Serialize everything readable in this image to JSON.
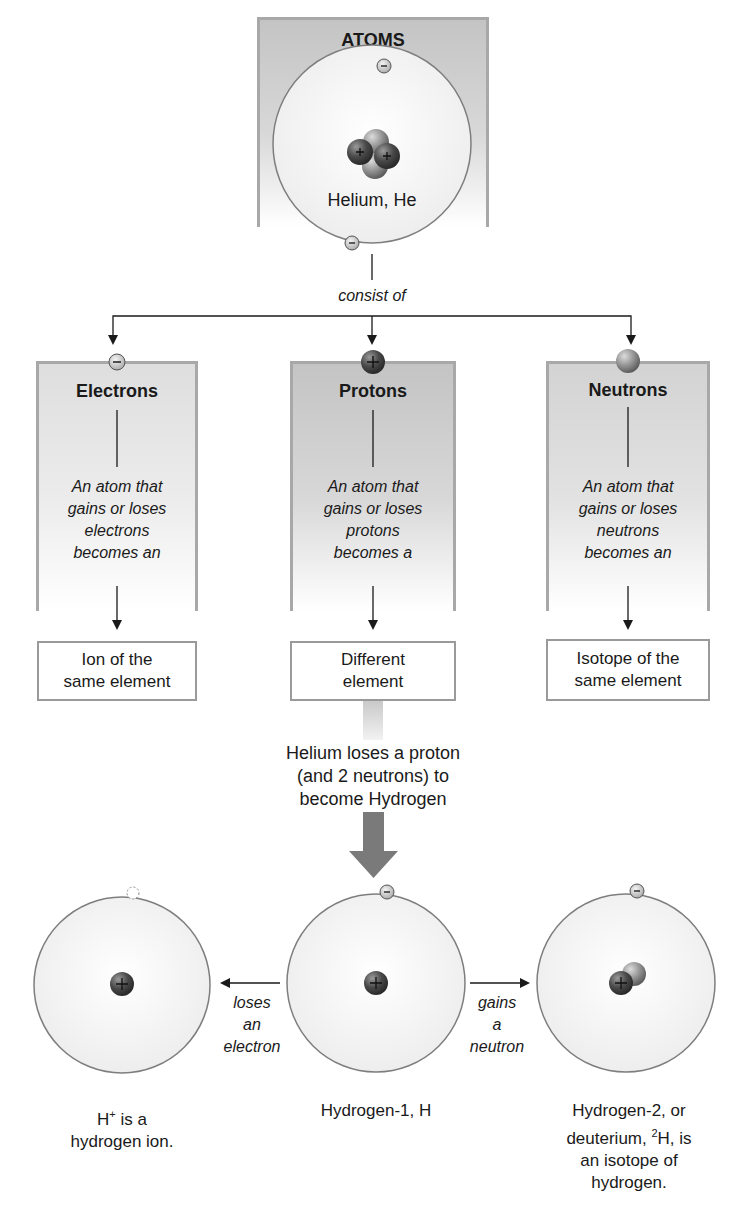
{
  "title": "ATOMS",
  "helium_label": "Helium, He",
  "connector_label": "consist of",
  "particles": [
    {
      "name": "Electrons",
      "description_lines": [
        "An atom that",
        "gains or loses",
        "electrons",
        "becomes an"
      ],
      "result_lines": [
        "Ion of the",
        "same element"
      ],
      "charge": "-"
    },
    {
      "name": "Protons",
      "description_lines": [
        "An atom that",
        "gains or loses",
        "protons",
        "becomes a"
      ],
      "result_lines": [
        "Different",
        "element"
      ],
      "charge": "+"
    },
    {
      "name": "Neutrons",
      "description_lines": [
        "An atom that",
        "gains or loses",
        "neutrons",
        "becomes an"
      ],
      "result_lines": [
        "Isotope of the",
        "same element"
      ],
      "charge": "0"
    }
  ],
  "transition_lines": [
    "Helium loses a proton",
    "(and 2 neutrons) to",
    "become Hydrogen"
  ],
  "hydrogen": {
    "ion": {
      "caption_line1_prefix": "H",
      "caption_line1_sup": "+",
      "caption_line1_suffix": " is a",
      "caption_line2": "hydrogen ion."
    },
    "h1": {
      "caption": "Hydrogen-1, H"
    },
    "h2": {
      "caption_line1": "Hydrogen-2, or",
      "caption_line2_prefix": "deuterium, ",
      "caption_line2_sup": "2",
      "caption_line2_suffix": "H, is",
      "caption_line3": "an isotope of",
      "caption_line4": "hydrogen."
    }
  },
  "arrow_labels": {
    "loses": [
      "loses",
      "an",
      "electron"
    ],
    "gains": [
      "gains",
      "a",
      "neutron"
    ]
  },
  "colors": {
    "panel_border": "#a8a8a8",
    "orbit": "#8a8a8a",
    "proton": "#5a5a5a",
    "neutron": "#9a9a9a",
    "big_arrow": "#7a7a7a"
  }
}
